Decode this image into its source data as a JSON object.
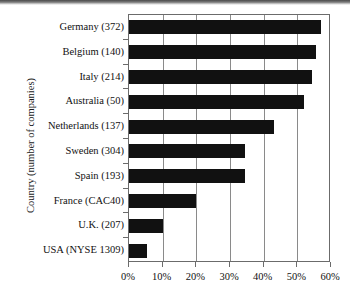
{
  "chart_data": {
    "type": "bar",
    "orientation": "horizontal",
    "title": "",
    "xlabel": "",
    "ylabel": "Country (number of companies)",
    "categories": [
      "Germany (372)",
      "Belgium (140)",
      "Italy (214)",
      "Australia (50)",
      "Netherlands (137)",
      "Sweden (304)",
      "Spain (193)",
      "France (CAC40)",
      "U.K. (207)",
      "USA (NYSE 1309)"
    ],
    "values": [
      57.0,
      55.5,
      54.5,
      52.0,
      43.0,
      34.5,
      34.5,
      20.0,
      10.0,
      5.3
    ],
    "value_unit": "%",
    "xlim": [
      0,
      60
    ],
    "xticks": [
      0,
      10,
      20,
      30,
      40,
      50,
      60
    ],
    "xticklabels": [
      "0%",
      "10%",
      "20%",
      "30%",
      "40%",
      "50%",
      "60%"
    ],
    "grid": true,
    "grid_axis": "x",
    "legend": false,
    "bar_color": "#111111",
    "frame_color": "#6b6b6b"
  }
}
